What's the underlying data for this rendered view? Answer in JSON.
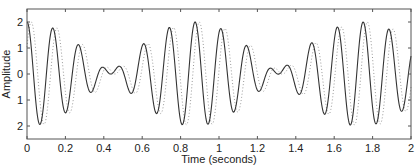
{
  "chart_data": {
    "type": "line",
    "title": "",
    "xlabel": "Time (seconds)",
    "ylabel": "Amplitude",
    "xlim": [
      0,
      2
    ],
    "ylim": [
      -2.5,
      2.5
    ],
    "grid": false,
    "legend": null,
    "x_ticks": [
      0,
      0.2,
      0.4,
      0.6,
      0.8,
      1,
      1.2,
      1.4,
      1.6,
      1.8,
      2
    ],
    "x_tick_labels": [
      "0",
      "0.2",
      "0.4",
      "0.6",
      "0.8",
      "1",
      "1.2",
      "1.4",
      "1.6",
      "1.8",
      "2"
    ],
    "y_ticks": [
      2,
      1,
      0,
      -1,
      -2
    ],
    "y_tick_labels": [
      "2",
      "1",
      "0",
      "1",
      "2"
    ],
    "series": [
      {
        "name": "signal",
        "style": "solid",
        "color": "#333333",
        "model": {
          "f1": 6.85,
          "f2": 8.0,
          "shift": 0
        },
        "x": [
          0,
          0.065,
          0.135,
          0.2,
          0.27,
          0.335,
          0.4,
          0.45,
          0.5,
          0.55,
          0.61,
          0.68,
          0.745,
          0.81,
          0.875,
          0.945,
          1.01,
          1.08,
          1.145,
          1.21,
          1.28,
          1.33,
          1.38,
          1.43,
          1.49,
          1.555,
          1.62,
          1.69,
          1.755,
          1.825,
          1.89,
          1.955,
          2.0
        ],
        "values": [
          2.0,
          -1.95,
          1.8,
          -1.5,
          1.15,
          -0.75,
          0.3,
          0.0,
          0.2,
          -0.65,
          1.05,
          -1.45,
          1.7,
          -1.95,
          2.0,
          -1.95,
          1.8,
          -1.6,
          1.25,
          -0.8,
          0.35,
          0.05,
          0.15,
          -0.6,
          0.95,
          -1.4,
          1.65,
          -1.9,
          2.0,
          -1.95,
          1.85,
          -1.6,
          0.5
        ]
      },
      {
        "name": "shifted signal",
        "style": "dotted",
        "color": "#999999",
        "model": {
          "f1": 6.85,
          "f2": 8.0,
          "shift": 0.022
        },
        "x": [
          0.022,
          0.087,
          0.157,
          0.222,
          0.292,
          0.357,
          0.422,
          0.472,
          0.522,
          0.572,
          0.632,
          0.702,
          0.767,
          0.832,
          0.897,
          0.967,
          1.032,
          1.102,
          1.167,
          1.232,
          1.302,
          1.352,
          1.402,
          1.452,
          1.512,
          1.577,
          1.642,
          1.712,
          1.777,
          1.847,
          1.912,
          1.977
        ],
        "values": [
          2.0,
          -1.95,
          1.8,
          -1.5,
          1.15,
          -0.75,
          0.3,
          0.0,
          0.2,
          -0.65,
          1.05,
          -1.45,
          1.7,
          -1.95,
          2.0,
          -1.95,
          1.8,
          -1.6,
          1.25,
          -0.8,
          0.35,
          0.05,
          0.15,
          -0.6,
          0.95,
          -1.4,
          1.65,
          -1.9,
          2.0,
          -1.95,
          1.85,
          -1.6
        ]
      }
    ],
    "plot_area_px": {
      "left": 27,
      "right": 411,
      "top": 9,
      "bottom": 139
    }
  }
}
